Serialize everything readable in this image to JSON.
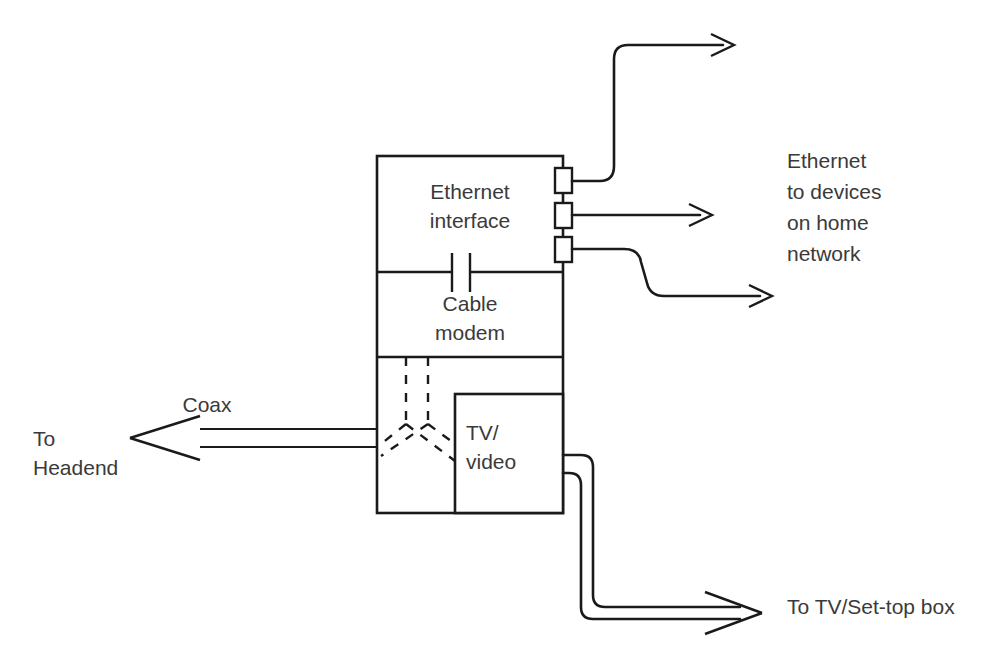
{
  "diagram": {
    "background_color": "#ffffff",
    "line_color": "#1a1a1a",
    "text_color": "#3a3a3a",
    "blocks": [
      {
        "id": "ethernet-interface",
        "label_line1": "Ethernet",
        "label_line2": "interface"
      },
      {
        "id": "cable-modem",
        "label_line1": "Cable",
        "label_line2": "modem"
      },
      {
        "id": "splitter",
        "label": ""
      },
      {
        "id": "tv-video",
        "label_line1": "TV/",
        "label_line2": "video"
      }
    ],
    "labels": {
      "coax": "Coax",
      "to_headend_line1": "To",
      "to_headend_line2": "Headend",
      "ethernet_devices_line1": "Ethernet",
      "ethernet_devices_line2": "to devices",
      "ethernet_devices_line3": "on home",
      "ethernet_devices_line4": "network",
      "to_tv_settop": "To TV/Set-top box"
    },
    "ports": [
      {
        "id": "ethernet-port-1"
      },
      {
        "id": "ethernet-port-2"
      },
      {
        "id": "ethernet-port-3"
      }
    ],
    "connections": [
      {
        "id": "ethernet-cable-1",
        "from": "ethernet-port-1",
        "to": "home-network",
        "style": "curved-up"
      },
      {
        "id": "ethernet-cable-2",
        "from": "ethernet-port-2",
        "to": "home-network",
        "style": "straight"
      },
      {
        "id": "ethernet-cable-3",
        "from": "ethernet-port-3",
        "to": "home-network",
        "style": "curved-down"
      },
      {
        "id": "coax-cable",
        "from": "splitter",
        "to": "headend",
        "style": "double-line"
      },
      {
        "id": "tv-cable",
        "from": "tv-video",
        "to": "tv-settop-box",
        "style": "double-line"
      }
    ]
  }
}
